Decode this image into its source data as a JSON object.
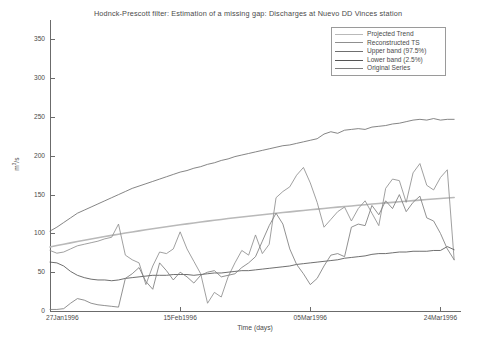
{
  "chart_data": {
    "type": "line",
    "title": "Hodnck-Prescott filter: Estimation of a missing gap: Discharges at Nuevo DD Vinces station",
    "xlabel": "Time (days)",
    "ylabel": "m3/s",
    "ylabel_base": "m",
    "ylabel_sup": "3",
    "ylabel_tail": "/s",
    "grid": false,
    "legend_position": "top-right",
    "ylim": [
      0,
      375
    ],
    "yticks": [
      0,
      50,
      100,
      150,
      200,
      250,
      300,
      350
    ],
    "ytick_labels": [
      "0",
      "50",
      "100",
      "150",
      "200",
      "250",
      "300",
      "350"
    ],
    "xlim": [
      0,
      60
    ],
    "xticks": [
      0,
      19,
      38,
      57
    ],
    "xtick_labels": [
      "27Jan1996",
      "15Feb1996",
      "05Mar1996",
      "24Mar1996"
    ],
    "colors": {
      "projected_trend": "#b9b9b9",
      "reconstructed_ts": "#8f8f8f",
      "upper_band": "#6f6f6f",
      "lower_band": "#555555",
      "original_series": "#7d7d7d",
      "axis": "#6b6b6b",
      "text": "#4a4a4a",
      "background": "#ffffff"
    },
    "series": [
      {
        "name": "Projected Trend",
        "color": "#b9b9b9",
        "x": [
          0,
          1,
          2,
          3,
          4,
          5,
          6,
          7,
          8,
          9,
          10,
          11,
          12,
          13,
          14,
          15,
          16,
          17,
          18,
          19,
          20,
          21,
          22,
          23,
          24,
          25,
          26,
          27,
          28,
          29,
          30,
          31,
          32,
          33,
          34,
          35,
          36,
          37,
          38,
          39,
          40,
          41,
          42,
          43,
          44,
          45,
          46,
          47,
          48,
          49,
          50,
          51,
          52,
          53,
          54,
          55,
          56,
          57,
          58,
          59
        ],
        "values": [
          82.5,
          84.3,
          86.1,
          87.8,
          89.5,
          91.2,
          92.8,
          94.4,
          96.0,
          97.5,
          99.0,
          100.5,
          101.9,
          103.3,
          104.7,
          106.0,
          107.3,
          108.6,
          109.9,
          111.1,
          112.3,
          113.5,
          114.7,
          115.8,
          116.9,
          118.0,
          119.1,
          120.1,
          121.1,
          122.1,
          123.1,
          124.1,
          125.0,
          126.0,
          126.9,
          127.8,
          128.7,
          129.6,
          130.5,
          131.3,
          132.1,
          133.0,
          133.8,
          134.6,
          135.4,
          136.2,
          137.0,
          137.8,
          138.5,
          139.3,
          140.0,
          140.8,
          141.5,
          142.2,
          142.9,
          143.6,
          144.3,
          145.0,
          145.6,
          146.3
        ]
      },
      {
        "name": "Reconstructed TS",
        "color": "#8f8f8f",
        "x": [
          0,
          1,
          2,
          3,
          4,
          5,
          6,
          7,
          8,
          9,
          10,
          11,
          12,
          13,
          14,
          15,
          16,
          17,
          18,
          19,
          20,
          21,
          22,
          23,
          24,
          25,
          26,
          27,
          28,
          29,
          30,
          31,
          32,
          33,
          34,
          35,
          36,
          37,
          38,
          39,
          40,
          41,
          42,
          43,
          44,
          45,
          46,
          47,
          48,
          49,
          50,
          51,
          52,
          53,
          54,
          55,
          56,
          57,
          58,
          59
        ],
        "values": [
          78.0,
          74.5,
          76.0,
          80.0,
          84.0,
          86.0,
          88.0,
          90.0,
          93.0,
          95.0,
          112.0,
          72.0,
          66.0,
          62.0,
          34.0,
          58.0,
          76.0,
          74.0,
          80.0,
          102.0,
          80.0,
          64.0,
          48.0,
          10.0,
          24.0,
          18.0,
          44.0,
          62.0,
          78.0,
          72.0,
          98.0,
          74.0,
          86.0,
          146.0,
          154.0,
          160.0,
          175.0,
          185.0,
          165.0,
          140.0,
          108.0,
          118.0,
          128.0,
          134.0,
          116.0,
          132.0,
          142.0,
          126.0,
          110.0,
          158.0,
          170.0,
          168.0,
          140.0,
          178.0,
          190.0,
          162.0,
          156.0,
          172.0,
          182.0,
          66.0
        ]
      },
      {
        "name": "Upper band (97.5%)",
        "color": "#6f6f6f",
        "x": [
          0,
          1,
          2,
          3,
          4,
          5,
          6,
          7,
          8,
          9,
          10,
          11,
          12,
          13,
          14,
          15,
          16,
          17,
          18,
          19,
          20,
          21,
          22,
          23,
          24,
          25,
          26,
          27,
          28,
          29,
          30,
          31,
          32,
          33,
          34,
          35,
          36,
          37,
          38,
          39,
          40,
          41,
          42,
          43,
          44,
          45,
          46,
          47,
          48,
          49,
          50,
          51,
          52,
          53,
          54,
          55,
          56,
          57,
          58,
          59
        ],
        "values": [
          103.0,
          108.0,
          114.0,
          120.0,
          126.0,
          130.0,
          134.0,
          138.0,
          142.0,
          146.0,
          150.0,
          154.0,
          158.0,
          161.0,
          164.0,
          167.0,
          170.0,
          173.0,
          176.0,
          179.0,
          181.0,
          184.0,
          186.0,
          189.0,
          191.0,
          194.0,
          196.0,
          199.0,
          201.0,
          203.0,
          205.0,
          207.0,
          209.0,
          211.0,
          213.0,
          214.0,
          216.0,
          218.0,
          220.0,
          222.0,
          228.0,
          231.0,
          229.0,
          233.0,
          234.0,
          235.0,
          234.0,
          237.0,
          238.0,
          239.0,
          241.0,
          242.0,
          244.0,
          246.0,
          247.0,
          246.0,
          248.0,
          246.0,
          247.0,
          247.0
        ]
      },
      {
        "name": "Lower band (2.5%)",
        "color": "#555555",
        "x": [
          0,
          1,
          2,
          3,
          4,
          5,
          6,
          7,
          8,
          9,
          10,
          11,
          12,
          13,
          14,
          15,
          16,
          17,
          18,
          19,
          20,
          21,
          22,
          23,
          24,
          25,
          26,
          27,
          28,
          29,
          30,
          31,
          32,
          33,
          34,
          35,
          36,
          37,
          38,
          39,
          40,
          41,
          42,
          43,
          44,
          45,
          46,
          47,
          48,
          49,
          50,
          51,
          52,
          53,
          54,
          55,
          56,
          57,
          58,
          59
        ],
        "values": [
          63.0,
          62.0,
          58.0,
          51.0,
          46.0,
          43.0,
          41.0,
          40.0,
          40.0,
          39.0,
          40.0,
          42.0,
          43.0,
          44.0,
          45.0,
          46.0,
          46.0,
          46.0,
          47.0,
          47.0,
          47.0,
          46.0,
          47.0,
          48.0,
          49.0,
          49.0,
          50.0,
          51.0,
          52.0,
          52.0,
          53.0,
          54.0,
          55.0,
          56.0,
          57.0,
          58.0,
          60.0,
          61.0,
          62.0,
          63.0,
          64.0,
          65.0,
          66.0,
          68.0,
          69.0,
          70.0,
          71.0,
          73.0,
          74.0,
          74.0,
          75.0,
          76.0,
          76.0,
          77.0,
          77.0,
          77.0,
          78.0,
          78.0,
          83.0,
          79.0
        ]
      },
      {
        "name": "Original Series",
        "color": "#7d7d7d",
        "x": [
          0,
          1,
          2,
          3,
          4,
          5,
          6,
          7,
          8,
          9,
          10,
          11,
          12,
          13,
          14,
          15,
          16,
          17,
          18,
          19,
          20,
          21,
          22,
          23,
          24,
          25,
          26,
          27,
          28,
          29,
          30,
          31,
          32,
          33,
          34,
          35,
          36,
          37,
          38,
          39,
          40,
          41,
          42,
          43,
          44,
          45,
          46,
          47,
          48,
          49,
          50,
          51,
          52,
          53,
          54,
          55,
          56,
          57,
          58,
          59
        ],
        "values": [
          2.0,
          2.0,
          3.0,
          10.0,
          16.0,
          14.0,
          10.0,
          8.0,
          7.0,
          6.0,
          5.0,
          42.0,
          48.0,
          56.0,
          38.0,
          28.0,
          62.0,
          52.0,
          40.0,
          50.0,
          44.0,
          36.0,
          46.0,
          50.0,
          52.0,
          44.0,
          46.0,
          48.0,
          56.0,
          62.0,
          70.0,
          90.0,
          110.0,
          126.0,
          112.0,
          80.0,
          60.0,
          48.0,
          34.0,
          42.0,
          58.0,
          72.0,
          74.0,
          70.0,
          108.0,
          112.0,
          110.0,
          136.0,
          124.0,
          142.0,
          132.0,
          150.0,
          128.0,
          140.0,
          148.0,
          120.0,
          116.0,
          100.0,
          80.0,
          66.0
        ]
      }
    ]
  },
  "legend": {
    "items": [
      {
        "label": "Projected Trend",
        "color": "#b9b9b9"
      },
      {
        "label": "Reconstructed TS",
        "color": "#8f8f8f"
      },
      {
        "label": "Upper band (97.5%)",
        "color": "#6f6f6f"
      },
      {
        "label": "Lower band (2.5%)",
        "color": "#555555"
      },
      {
        "label": "Original Series",
        "color": "#7d7d7d"
      }
    ]
  }
}
